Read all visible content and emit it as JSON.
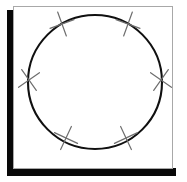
{
  "figure": {
    "canvas": {
      "width": 187,
      "height": 182,
      "background": "#ffffff"
    },
    "shadow": {
      "name": "drop-shadow-frame",
      "color": "#080808",
      "left_bar": {
        "x": 7,
        "y": 10,
        "width": 7,
        "height": 166
      },
      "bottom_bar": {
        "x": 7,
        "y": 168,
        "width": 169,
        "height": 8
      }
    },
    "panel": {
      "name": "white-panel",
      "x": 13,
      "y": 6,
      "width": 159,
      "height": 162,
      "fill": "#ffffff",
      "border_color": "#a8a8a8",
      "border_width": 1
    },
    "circle": {
      "name": "main-circle",
      "cx": 95,
      "cy": 82,
      "r": 67,
      "stroke": "#101010",
      "stroke_width": 2.1,
      "fill": "none"
    },
    "cross_marks": {
      "name": "cross-marks",
      "stroke": "#6e6e6e",
      "stroke_width": 1.2,
      "arm_length": 9,
      "count": 6,
      "items": [
        {
          "label": "cross-upper-left",
          "cx": 62,
          "cy": 24,
          "angle_deg": 120,
          "tilt_deg": 25
        },
        {
          "label": "cross-upper-right",
          "cx": 128,
          "cy": 24,
          "angle_deg": 60,
          "tilt_deg": -25
        },
        {
          "label": "cross-left",
          "cx": 29,
          "cy": 80,
          "angle_deg": 180,
          "tilt_deg": 10
        },
        {
          "label": "cross-right",
          "cx": 161,
          "cy": 80,
          "angle_deg": 0,
          "tilt_deg": -10
        },
        {
          "label": "cross-lower-left",
          "cx": 66,
          "cy": 138,
          "angle_deg": 240,
          "tilt_deg": -20
        },
        {
          "label": "cross-lower-right",
          "cx": 126,
          "cy": 138,
          "angle_deg": 300,
          "tilt_deg": 20
        }
      ]
    }
  }
}
